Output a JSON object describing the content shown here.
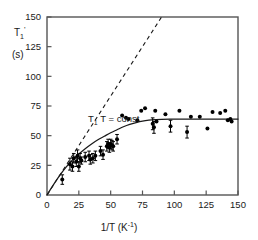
{
  "chart_data": {
    "type": "scatter",
    "title": "",
    "xlabel": "1/T  (K⁻¹)",
    "ylabel_line1": "T₁'",
    "ylabel_line2": "(s)",
    "xlabel_main": "1/T",
    "xlabel_unit": "(K",
    "xlabel_unit_exp": "-1",
    "xlabel_unit_close": ")",
    "ylabel_symbol": "T",
    "ylabel_sub": "1",
    "ylabel_prime": "'",
    "ylabel_units": "(s)",
    "xlim": [
      0,
      150
    ],
    "ylim": [
      0,
      150
    ],
    "xticks": [
      0,
      25,
      50,
      75,
      100,
      125,
      150
    ],
    "yticks": [
      0,
      25,
      50,
      75,
      100,
      125,
      150
    ],
    "xtick_labels": [
      "0",
      "25",
      "50",
      "75",
      "100",
      "125",
      "150"
    ],
    "ytick_labels": [
      "0",
      "25",
      "50",
      "75",
      "100",
      "125",
      "150"
    ],
    "grid": false,
    "legend": "none",
    "frame": "box",
    "tick_direction": "in",
    "annotations": [
      {
        "name": "t1-t-const",
        "text": "T₁ T = const.",
        "text_symbol": "T",
        "text_sub": "1",
        "text_rest": " T = const.",
        "x": 88,
        "y": 122
      }
    ],
    "series": [
      {
        "name": "dashed-reference-line",
        "type": "line",
        "style": "dashed",
        "color": "#1a1a1a",
        "description": "T1 T = const. reference asymptote through origin",
        "points": [
          [
            0,
            0
          ],
          [
            90,
            150
          ]
        ]
      },
      {
        "name": "fitted-curve",
        "type": "line",
        "style": "solid",
        "color": "#1a1a1a",
        "description": "saturating fit rising from origin to plateau near 64 s",
        "points": [
          [
            0,
            0
          ],
          [
            5,
            8.5
          ],
          [
            10,
            16.5
          ],
          [
            15,
            23.5
          ],
          [
            20,
            29.5
          ],
          [
            25,
            34.5
          ],
          [
            30,
            39.0
          ],
          [
            35,
            43.0
          ],
          [
            40,
            46.5
          ],
          [
            45,
            49.5
          ],
          [
            50,
            52.5
          ],
          [
            55,
            55.0
          ],
          [
            60,
            57.5
          ],
          [
            65,
            59.5
          ],
          [
            70,
            61.0
          ],
          [
            75,
            62.2
          ],
          [
            80,
            63.0
          ],
          [
            85,
            63.5
          ],
          [
            90,
            63.8
          ],
          [
            100,
            64.0
          ],
          [
            110,
            64.0
          ],
          [
            120,
            64.0
          ],
          [
            130,
            64.0
          ],
          [
            140,
            64.0
          ],
          [
            150,
            64.0
          ]
        ]
      },
      {
        "name": "measured-data-points",
        "type": "scatter",
        "marker": "filled-circle",
        "color": "#000000",
        "errorbars": "vertical",
        "points": [
          {
            "x": 12,
            "y": 13,
            "err": 4
          },
          {
            "x": 18,
            "y": 26,
            "err": 5
          },
          {
            "x": 20,
            "y": 24,
            "err": 4
          },
          {
            "x": 21,
            "y": 31,
            "err": 4
          },
          {
            "x": 23,
            "y": 28,
            "err": 4
          },
          {
            "x": 24,
            "y": 33,
            "err": 5
          },
          {
            "x": 25,
            "y": 24,
            "err": 4
          },
          {
            "x": 26,
            "y": 31,
            "err": 4
          },
          {
            "x": 27,
            "y": 29,
            "err": 3
          },
          {
            "x": 30,
            "y": 32,
            "err": 4
          },
          {
            "x": 33,
            "y": 33,
            "err": 4
          },
          {
            "x": 34,
            "y": 30,
            "err": 4
          },
          {
            "x": 36,
            "y": 31,
            "err": 4
          },
          {
            "x": 38,
            "y": 33,
            "err": 4
          },
          {
            "x": 42,
            "y": 37,
            "err": 4
          },
          {
            "x": 44,
            "y": 34,
            "err": 4
          },
          {
            "x": 47,
            "y": 41,
            "err": 4
          },
          {
            "x": 48,
            "y": 43,
            "err": 4
          },
          {
            "x": 49,
            "y": 40,
            "err": 4
          },
          {
            "x": 50,
            "y": 43,
            "err": 4
          },
          {
            "x": 51,
            "y": 42,
            "err": 4
          },
          {
            "x": 52,
            "y": 41,
            "err": 4
          },
          {
            "x": 55,
            "y": 47,
            "err": 4
          },
          {
            "x": 59,
            "y": 67,
            "err": 0
          },
          {
            "x": 62,
            "y": 65,
            "err": 0
          },
          {
            "x": 64,
            "y": 64,
            "err": 0
          },
          {
            "x": 71,
            "y": 63,
            "err": 0
          },
          {
            "x": 74,
            "y": 71,
            "err": 0
          },
          {
            "x": 77,
            "y": 73,
            "err": 0
          },
          {
            "x": 83,
            "y": 60,
            "err": 5
          },
          {
            "x": 84,
            "y": 57,
            "err": 5
          },
          {
            "x": 85,
            "y": 71,
            "err": 0
          },
          {
            "x": 86,
            "y": 62,
            "err": 0
          },
          {
            "x": 93,
            "y": 68,
            "err": 0
          },
          {
            "x": 97,
            "y": 58,
            "err": 5
          },
          {
            "x": 104,
            "y": 71,
            "err": 0
          },
          {
            "x": 110,
            "y": 53,
            "err": 5
          },
          {
            "x": 113,
            "y": 66,
            "err": 0
          },
          {
            "x": 120,
            "y": 66,
            "err": 0
          },
          {
            "x": 126,
            "y": 56,
            "err": 0
          },
          {
            "x": 130,
            "y": 70,
            "err": 0
          },
          {
            "x": 136,
            "y": 69,
            "err": 0
          },
          {
            "x": 140,
            "y": 71,
            "err": 0
          },
          {
            "x": 142,
            "y": 63,
            "err": 0
          },
          {
            "x": 144,
            "y": 64,
            "err": 0
          },
          {
            "x": 145,
            "y": 62,
            "err": 0
          }
        ]
      }
    ]
  }
}
